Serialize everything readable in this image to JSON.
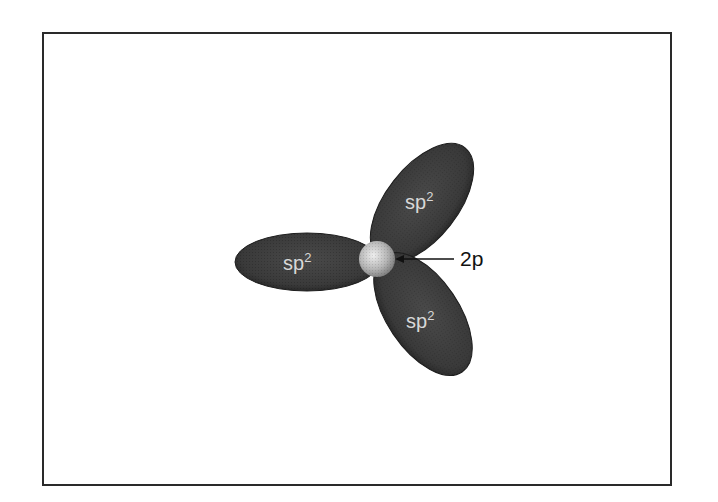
{
  "diagram": {
    "lobes": [
      {
        "id": "left",
        "label": "sp",
        "sup": "2"
      },
      {
        "id": "upper",
        "label": "sp",
        "sup": "2"
      },
      {
        "id": "lower",
        "label": "sp",
        "sup": "2"
      }
    ],
    "nucleus_label": "2p",
    "colors": {
      "lobe_fill": "#3d3d3d",
      "lobe_edge": "#1f1f1f",
      "nucleus_light": "#e6e6e6",
      "nucleus_dark": "#8a8a8a",
      "frame": "#2a2a2a",
      "label_text": "#d8d8d8",
      "arrow": "#111111"
    }
  }
}
